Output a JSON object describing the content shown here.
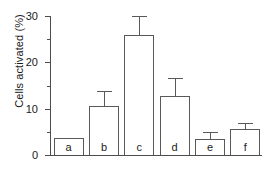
{
  "chart_data": {
    "type": "bar",
    "title": "",
    "xlabel": "",
    "ylabel": "Cells activated (%)",
    "categories": [
      "a",
      "b",
      "c",
      "d",
      "e",
      "f"
    ],
    "values": [
      3.6,
      10.6,
      25.9,
      12.8,
      3.4,
      5.7
    ],
    "errors_upper": [
      0.0,
      3.3,
      4.1,
      3.9,
      1.5,
      1.3
    ],
    "error_tops": [
      3.6,
      13.9,
      30.0,
      16.7,
      4.9,
      7.0
    ],
    "ylim": [
      0,
      30
    ],
    "yticks": [
      0,
      10,
      20,
      30
    ],
    "yticklabels": [
      "0",
      "10",
      "20",
      "30"
    ],
    "yminorticks": [
      5,
      15,
      25
    ],
    "grid": false,
    "legend": null,
    "bar_facecolor": "#ffffff",
    "bar_edgecolor": "#595959",
    "axis_color": "#4d4d4d",
    "text_color": "#1a1a1a",
    "background": "#ffffff"
  }
}
